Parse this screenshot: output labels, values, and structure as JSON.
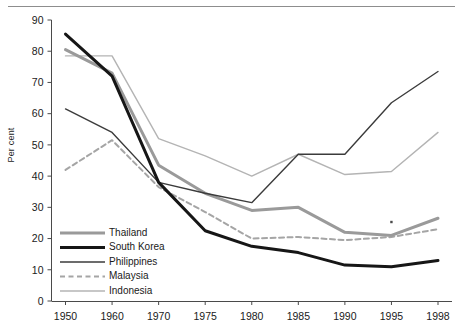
{
  "figure": {
    "y_axis_title": "Per cent",
    "top_rule_name": "header-rule"
  },
  "chart_data": {
    "type": "line",
    "title": "",
    "subtitle": "",
    "xlabel": "",
    "ylabel": "Per cent",
    "categories": [
      "1950",
      "1960",
      "1970",
      "1975",
      "1980",
      "1985",
      "1990",
      "1995",
      "1998"
    ],
    "ylim": [
      0,
      90
    ],
    "yticks": [
      0,
      10,
      20,
      30,
      40,
      50,
      60,
      70,
      80,
      90
    ],
    "ytick_labels": [
      "0",
      "10",
      "20",
      "30",
      "40",
      "50",
      "60",
      "70",
      "80",
      "90"
    ],
    "grid": false,
    "legend_position": "inside-bottom-left",
    "annotations": [
      {
        "name": "stray-dot-marker",
        "x": "1995",
        "y": 25.3
      }
    ],
    "series": [
      {
        "name": "Thailand",
        "color": "#9a9a9a",
        "line_style": "solid",
        "line_width": 3,
        "values": [
          80.5,
          73.0,
          43.5,
          34.5,
          29.0,
          30.0,
          22.0,
          21.0,
          26.5
        ]
      },
      {
        "name": "South Korea",
        "color": "#161616",
        "line_style": "solid",
        "line_width": 3,
        "values": [
          85.5,
          72.0,
          38.0,
          22.5,
          17.5,
          15.5,
          11.5,
          11.0,
          13.0
        ]
      },
      {
        "name": "Philippines",
        "color": "#3b3b3b",
        "line_style": "solid",
        "line_width": 1.4,
        "values": [
          61.5,
          54.0,
          38.0,
          34.5,
          31.5,
          47.0,
          47.0,
          63.5,
          73.5
        ]
      },
      {
        "name": "Malaysia",
        "color": "#a5a5a5",
        "line_style": "dashed",
        "line_width": 2,
        "values": [
          42.0,
          51.5,
          36.5,
          28.5,
          20.0,
          20.5,
          19.5,
          20.5,
          23.0
        ]
      },
      {
        "name": "Indonesia",
        "color": "#b4b4b4",
        "line_style": "solid",
        "line_width": 1.4,
        "values": [
          78.5,
          78.5,
          52.0,
          46.5,
          40.0,
          47.0,
          40.5,
          41.5,
          54.0
        ]
      }
    ]
  },
  "legend": {
    "items": [
      {
        "label": "Thailand"
      },
      {
        "label": "South Korea"
      },
      {
        "label": "Philippines"
      },
      {
        "label": "Malaysia"
      },
      {
        "label": "Indonesia"
      }
    ]
  }
}
